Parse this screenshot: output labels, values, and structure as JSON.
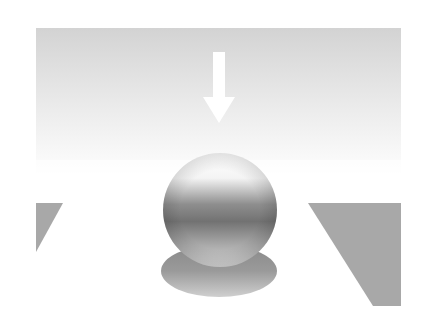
{
  "figure": {
    "colors": {
      "background": "#ffffff",
      "light_gradient_top": "#d3d3d3",
      "light_gradient_bottom": "#ffffff",
      "arrow": "#ffffff",
      "panel": "#a8a8a8",
      "sphere_highlight": "#ffffff",
      "sphere_mid": "#8a8a8a",
      "sphere_dark": "#6a6a6a",
      "shadow_light": "#c8c8c8",
      "shadow_dark": "#8c8c8c"
    },
    "elements": {
      "light_direction": "down",
      "arrow_label": "",
      "sphere_label": "",
      "shadow_label": ""
    }
  }
}
